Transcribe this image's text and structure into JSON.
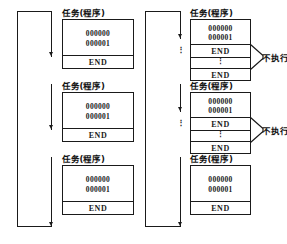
{
  "diagram": {
    "columns": [
      {
        "name": "left-column",
        "tasks": [
          {
            "label": "任务(程序)",
            "code_lines": [
              "000000",
              "000001"
            ],
            "end_label": "END",
            "has_skipped_section": false
          },
          {
            "label": "任务(程序)",
            "code_lines": [
              "000000",
              "000001"
            ],
            "end_label": "END",
            "has_skipped_section": false
          },
          {
            "label": "任务(程序)",
            "code_lines": [
              "000000",
              "000001"
            ],
            "end_label": "END",
            "has_skipped_section": false
          }
        ],
        "flow_dots": []
      },
      {
        "name": "right-column",
        "tasks": [
          {
            "label": "任务(程序)",
            "code_lines": [
              "000000",
              "000001"
            ],
            "end_label": "END",
            "has_skipped_section": true,
            "skipped_dots": "⋮",
            "second_end_label": "END",
            "annotation": "不执行"
          },
          {
            "label": "任务(程序)",
            "code_lines": [
              "000000",
              "000001"
            ],
            "end_label": "END",
            "has_skipped_section": true,
            "skipped_dots": "⋮",
            "second_end_label": "END",
            "annotation": "不执行"
          },
          {
            "label": "任务(程序)",
            "code_lines": [
              "000000",
              "000001"
            ],
            "end_label": "END",
            "has_skipped_section": false
          }
        ],
        "flow_dots": [
          "⋮",
          "⋮"
        ]
      }
    ],
    "colors": {
      "line": "#1a1a1a",
      "background": "#ffffff",
      "text": "#111111"
    }
  }
}
